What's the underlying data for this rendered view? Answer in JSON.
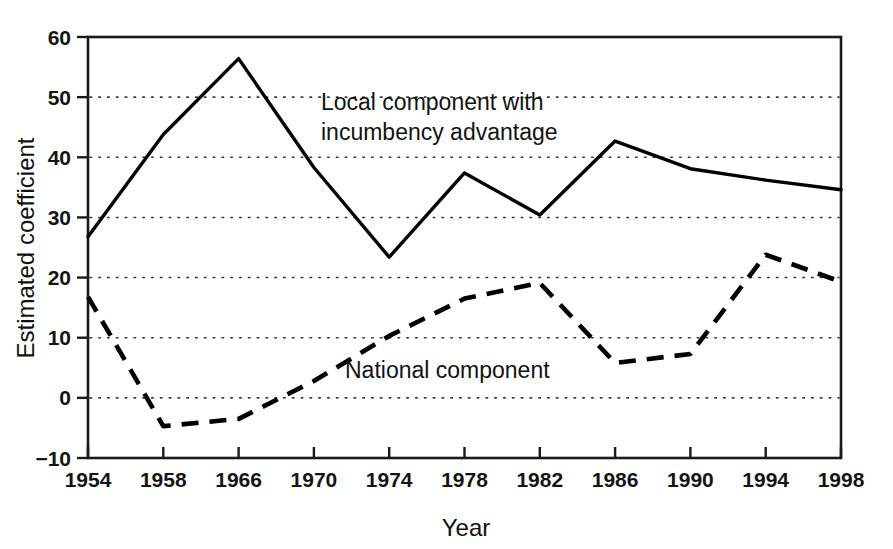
{
  "chart_data": {
    "type": "line",
    "title": "",
    "xlabel": "Year",
    "ylabel": "Estimated coefficient",
    "categories": [
      "1954",
      "1958",
      "1966",
      "1970",
      "1974",
      "1978",
      "1982",
      "1986",
      "1990",
      "1994",
      "1998"
    ],
    "x_tick_labels": [
      "1954",
      "1958",
      "1966",
      "1970",
      "1974",
      "1978",
      "1982",
      "1986",
      "1990",
      "1994",
      "1998"
    ],
    "y_tick_labels": [
      "60",
      "50",
      "40",
      "30",
      "20",
      "10",
      "0",
      "-10"
    ],
    "y_ticks": [
      60,
      50,
      40,
      30,
      20,
      10,
      0,
      -10
    ],
    "ylim": [
      -10,
      60
    ],
    "grid": "horizontal-dotted",
    "legend_position": "inline-annotation",
    "series": [
      {
        "name": "Local component with incumbency advantage",
        "style": "solid",
        "color": "#000000",
        "values": [
          26.8,
          43.8,
          56.4,
          38.3,
          23.4,
          37.4,
          30.4,
          42.7,
          38.1,
          36.2,
          34.6
        ]
      },
      {
        "name": "National component",
        "style": "dashed",
        "color": "#000000",
        "values": [
          16.8,
          -4.7,
          -3.5,
          2.8,
          10.3,
          16.5,
          19.1,
          5.8,
          7.3,
          23.8,
          19.3
        ]
      }
    ],
    "annotations": [
      {
        "id": "local-label",
        "lines": [
          "Local component with",
          "incumbency advantage"
        ],
        "x": 321,
        "y": 110
      },
      {
        "id": "national-label",
        "lines": [
          "National component"
        ],
        "x": 345,
        "y": 378
      }
    ]
  },
  "geometry": {
    "plot_left": 88,
    "plot_right": 841,
    "plot_top": 37,
    "plot_bottom": 458
  }
}
